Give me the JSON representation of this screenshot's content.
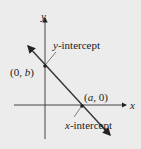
{
  "diagram": {
    "background": "#ececec",
    "stroke_color": "#222222",
    "axes": {
      "x_label": "x",
      "y_label": "y"
    },
    "points": [
      {
        "label_pre": "(0, ",
        "label_var": "b",
        "label_post": ")"
      },
      {
        "label_pre": "(",
        "label_var": "a",
        "label_post": ", 0)"
      }
    ],
    "annotations": {
      "y_intercept_var": "y",
      "y_intercept_rest": "-intercept",
      "x_intercept_var": "x",
      "x_intercept_rest": "-intercept"
    }
  }
}
